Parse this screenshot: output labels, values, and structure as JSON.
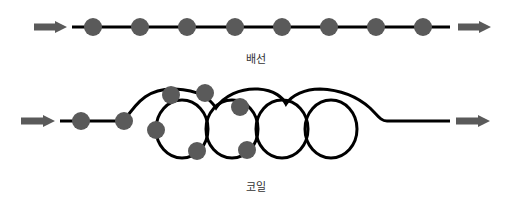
{
  "colors": {
    "line": "#000000",
    "dot": "#5a5a5a",
    "arrow": "#5a5a5a",
    "label": "#333333",
    "background": "#ffffff"
  },
  "straight": {
    "label": "배선",
    "label_pos": {
      "x": 256,
      "y": 50
    },
    "arrow_in": {
      "x1": 34,
      "x2": 67,
      "y": 27
    },
    "arrow_out": {
      "x1": 458,
      "x2": 491,
      "y": 27
    },
    "line": {
      "x1": 72,
      "x2": 450,
      "y": 27
    },
    "dots": [
      {
        "x": 93,
        "y": 27
      },
      {
        "x": 140,
        "y": 27
      },
      {
        "x": 187,
        "y": 27
      },
      {
        "x": 235,
        "y": 27
      },
      {
        "x": 282,
        "y": 27
      },
      {
        "x": 329,
        "y": 27
      },
      {
        "x": 376,
        "y": 27
      },
      {
        "x": 423,
        "y": 27
      }
    ],
    "dot_radius": 9
  },
  "coil": {
    "label": "코일",
    "label_pos": {
      "x": 256,
      "y": 178
    },
    "arrow_in": {
      "x1": 21,
      "x2": 55,
      "y": 121
    },
    "arrow_out": {
      "x1": 456,
      "x2": 490,
      "y": 121
    },
    "loops": [
      {
        "cx": 182,
        "cy": 129,
        "rx": 26,
        "ry": 29
      },
      {
        "cx": 232,
        "cy": 129,
        "rx": 26,
        "ry": 29
      },
      {
        "cx": 282,
        "cy": 129,
        "rx": 26,
        "ry": 29
      },
      {
        "cx": 331,
        "cy": 129,
        "rx": 26,
        "ry": 29
      }
    ],
    "dots": [
      {
        "x": 81,
        "y": 121
      },
      {
        "x": 124,
        "y": 121
      },
      {
        "x": 171,
        "y": 95
      },
      {
        "x": 205,
        "y": 93
      },
      {
        "x": 240,
        "y": 107
      },
      {
        "x": 156,
        "y": 130
      },
      {
        "x": 197,
        "y": 151
      },
      {
        "x": 247,
        "y": 150
      }
    ],
    "dot_radius": 9
  }
}
